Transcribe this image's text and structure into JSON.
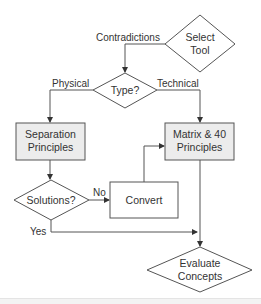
{
  "diagram": {
    "type": "flowchart",
    "colors": {
      "line": "#555555",
      "box_fill": "#ececec",
      "decision_fill": "#ffffff",
      "text": "#333333"
    },
    "nodes": {
      "select_tool": {
        "shape": "diamond",
        "line1": "Select",
        "line2": "Tool"
      },
      "type": {
        "shape": "diamond",
        "text": "Type?"
      },
      "separation": {
        "shape": "rectangle-shaded",
        "line1": "Separation",
        "line2": "Principles"
      },
      "matrix": {
        "shape": "rectangle-shaded",
        "line1": "Matrix & 40",
        "line2": "Principles"
      },
      "solutions": {
        "shape": "diamond",
        "text": "Solutions?"
      },
      "convert": {
        "shape": "rectangle",
        "text": "Convert"
      },
      "evaluate": {
        "shape": "diamond",
        "line1": "Evaluate",
        "line2": "Concepts"
      }
    },
    "edges": {
      "contradictions": {
        "from": "select_tool",
        "to": "type",
        "label": "Contradictions"
      },
      "physical": {
        "from": "type",
        "to": "separation",
        "label": "Physical"
      },
      "technical": {
        "from": "type",
        "to": "matrix",
        "label": "Technical"
      },
      "sep_to_sol": {
        "from": "separation",
        "to": "solutions",
        "label": ""
      },
      "no": {
        "from": "solutions",
        "to": "convert",
        "label": "No"
      },
      "convert_to_matrix": {
        "from": "convert",
        "to": "matrix",
        "label": ""
      },
      "yes": {
        "from": "solutions",
        "to": "evaluate",
        "label": "Yes"
      },
      "matrix_to_eval": {
        "from": "matrix",
        "to": "evaluate",
        "label": ""
      }
    }
  }
}
